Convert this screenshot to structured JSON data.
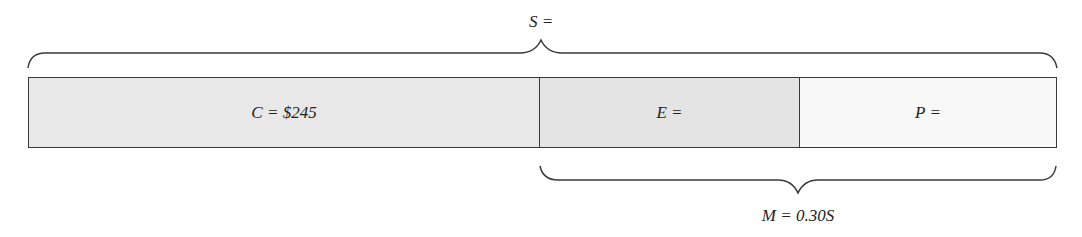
{
  "diagram": {
    "total": {
      "var": "S",
      "text": "S ="
    },
    "segments": [
      {
        "var": "C",
        "text": "C = $245",
        "width": 510,
        "color": "#e8e8e8"
      },
      {
        "var": "E",
        "text": "E =",
        "width": 260,
        "color": "#e4e4e4"
      },
      {
        "var": "P",
        "text": "P =",
        "width": 259,
        "color": "#f8f8f8"
      }
    ],
    "markup": {
      "var": "M",
      "text": "M = 0.30S"
    }
  }
}
